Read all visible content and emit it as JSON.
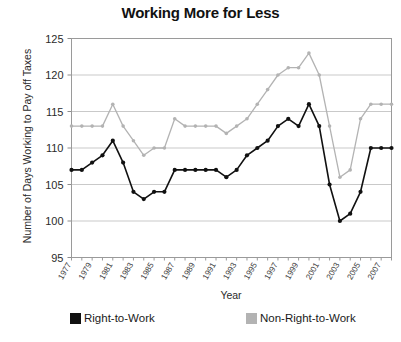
{
  "chart_data": {
    "type": "line",
    "title": "Working More for Less",
    "xlabel": "Year",
    "ylabel": "Number of Days Working to Pay off Taxes",
    "ylim": [
      95,
      125
    ],
    "yticks": [
      95,
      100,
      105,
      110,
      115,
      120,
      125
    ],
    "grid": true,
    "legend_position": "bottom",
    "x": [
      1977,
      1978,
      1979,
      1980,
      1981,
      1982,
      1983,
      1984,
      1985,
      1986,
      1987,
      1988,
      1989,
      1990,
      1991,
      1992,
      1993,
      1994,
      1995,
      1996,
      1997,
      1998,
      1999,
      2000,
      2001,
      2002,
      2003,
      2004,
      2005,
      2006,
      2007,
      2008
    ],
    "xtick_labels": [
      "1977",
      "1979",
      "1981",
      "1983",
      "1985",
      "1987",
      "1989",
      "1991",
      "1993",
      "1995",
      "1997",
      "1999",
      "2001",
      "2003",
      "2005",
      "2007"
    ],
    "series": [
      {
        "name": "Right-to-Work",
        "color": "#111111",
        "values": [
          107,
          107,
          108,
          109,
          111,
          108,
          104,
          103,
          104,
          104,
          107,
          107,
          107,
          107,
          107,
          106,
          107,
          109,
          110,
          111,
          113,
          114,
          113,
          116,
          113,
          105,
          100,
          101,
          104,
          110,
          110,
          110
        ]
      },
      {
        "name": "Non-Right-to-Work",
        "color": "#b3b3b3",
        "values": [
          113,
          113,
          113,
          113,
          116,
          113,
          111,
          109,
          110,
          110,
          114,
          113,
          113,
          113,
          113,
          112,
          113,
          114,
          116,
          118,
          120,
          121,
          121,
          123,
          120,
          113,
          106,
          107,
          114,
          116,
          116,
          116
        ]
      }
    ]
  },
  "legend": [
    {
      "label": "Right-to-Work",
      "color": "#111111"
    },
    {
      "label": "Non-Right-to-Work",
      "color": "#b3b3b3"
    }
  ]
}
